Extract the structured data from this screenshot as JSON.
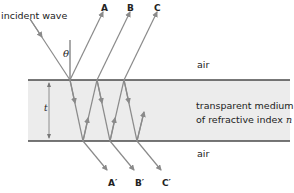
{
  "labels": {
    "incident": "incident wave",
    "theta": "θ",
    "ray_a": "A",
    "ray_b": "B",
    "ray_c": "C",
    "ray_a_prime": "A′",
    "ray_b_prime": "B′",
    "ray_c_prime": "C′",
    "air_top": "air",
    "air_bottom": "air",
    "medium_line1": "transparent medium",
    "medium_line2_prefix": "of refractive index ",
    "medium_line2_var": "n",
    "thickness": "t"
  },
  "colors": {
    "medium_fill": "#ececec",
    "boundary": "#4a4a4a",
    "ray": "#8a8a8a",
    "text": "#222222"
  }
}
